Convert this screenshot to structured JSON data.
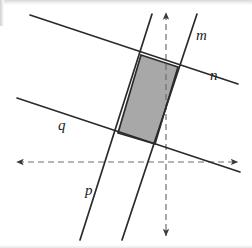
{
  "figure": {
    "background_color": "#ffffff",
    "line_color": "#2b2b2b",
    "axis_color": "#6e6e6e",
    "shade_fill": "#a8a8a8",
    "shade_stroke": "#2b2b2b",
    "label_color": "#1c1c1c",
    "width": 252,
    "height": 248
  },
  "axes": {
    "horizontal": {
      "name": "x-axis",
      "style": "dashed",
      "x1": 18,
      "y1": 162,
      "x2": 238,
      "y2": 162,
      "arrow_start": true,
      "arrow_end": true
    },
    "vertical": {
      "name": "y-axis",
      "style": "dashed",
      "x1": 166,
      "y1": 14,
      "x2": 166,
      "y2": 236,
      "arrow_start": true,
      "arrow_end": true
    }
  },
  "lines": [
    {
      "id": "m",
      "label": "m",
      "orientation": "steep",
      "x1": 197,
      "y1": 14,
      "x2": 122,
      "y2": 240,
      "label_x": 196,
      "label_y": 40
    },
    {
      "id": "n",
      "label": "n",
      "orientation": "shallow",
      "x1": 30,
      "y1": 15,
      "x2": 238,
      "y2": 84,
      "label_x": 210,
      "label_y": 80
    },
    {
      "id": "p",
      "label": "p",
      "orientation": "steep",
      "x1": 152,
      "y1": 14,
      "x2": 80,
      "y2": 240,
      "label_x": 85,
      "label_y": 195
    },
    {
      "id": "q",
      "label": "q",
      "orientation": "shallow",
      "x1": 17,
      "y1": 98,
      "x2": 240,
      "y2": 172,
      "label_x": 58,
      "label_y": 130
    }
  ],
  "shaded_region": {
    "name": "shaded-parallelogram",
    "fill": "#a8a8a8",
    "points": "141,55 178,67 155,144 118,133",
    "bounded_by": [
      "p",
      "m",
      "n",
      "q"
    ]
  }
}
